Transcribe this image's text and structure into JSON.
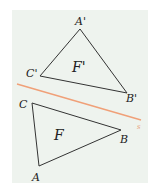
{
  "figure": {
    "background_color": "#eef3ee",
    "line_color": "#f0a078",
    "stroke_color": "#333333",
    "reflection_line": {
      "x1": 17,
      "y1": 84,
      "x2": 141,
      "y2": 120,
      "label": "s"
    },
    "image_triangle": {
      "name": "F'",
      "vertices": {
        "A'": [
          80,
          29
        ],
        "B'": [
          127,
          93
        ],
        "C'": [
          40,
          76
        ]
      }
    },
    "original_triangle": {
      "name": "F",
      "vertices": {
        "A": [
          39,
          166
        ],
        "B": [
          121,
          130
        ],
        "C": [
          32,
          103
        ]
      }
    },
    "labels": {
      "a_prime": "A'",
      "b_prime": "B'",
      "c_prime": "C'",
      "f_prime": "F'",
      "a": "A",
      "b": "B",
      "c": "C",
      "f": "F",
      "line": "s"
    }
  }
}
